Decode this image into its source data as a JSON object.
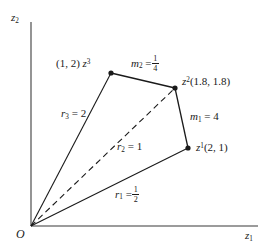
{
  "figure": {
    "axes": {
      "y_label": "z",
      "y_label_sub": "2",
      "x_label": "z",
      "x_label_sub": "1",
      "origin_label": "O"
    },
    "points": [
      {
        "name": "z1",
        "symbol": "z",
        "sup": "1",
        "coords": "(2, 1)",
        "label": "z¹(2, 1)",
        "x": 2,
        "y": 1
      },
      {
        "name": "z2",
        "symbol": "z",
        "sup": "2",
        "coords": "(1.8, 1.8)",
        "label": "z²(1.8, 1.8)",
        "x": 1.8,
        "y": 1.8
      },
      {
        "name": "z3",
        "symbol": "z",
        "sup": "3",
        "coords": "(1, 2)",
        "label": "(1, 2) z³",
        "x": 1,
        "y": 2
      }
    ],
    "rays": [
      {
        "name": "r1",
        "symbol": "r",
        "sub": "1",
        "eq": "=",
        "value_num": "1",
        "value_den": "2",
        "value_text": "1/2",
        "style": "solid",
        "to": "z1"
      },
      {
        "name": "r2",
        "symbol": "r",
        "sub": "2",
        "eq": "=",
        "value_text": "1",
        "style": "dashed",
        "to": "z2"
      },
      {
        "name": "r3",
        "symbol": "r",
        "sub": "3",
        "eq": "=",
        "value_text": "2",
        "style": "solid",
        "to": "z3"
      }
    ],
    "slopes": [
      {
        "name": "m1",
        "symbol": "m",
        "sub": "1",
        "eq": "=",
        "value_text": "4",
        "from": "z2",
        "to": "z1"
      },
      {
        "name": "m2",
        "symbol": "m",
        "sub": "2",
        "eq": "=",
        "value_num": "1",
        "value_den": "4",
        "value_text": "1/4",
        "from": "z3",
        "to": "z2"
      }
    ],
    "colors": {
      "ink": "#1a1a1a",
      "axis": "#6b6b6b",
      "background": "#ffffff"
    }
  }
}
